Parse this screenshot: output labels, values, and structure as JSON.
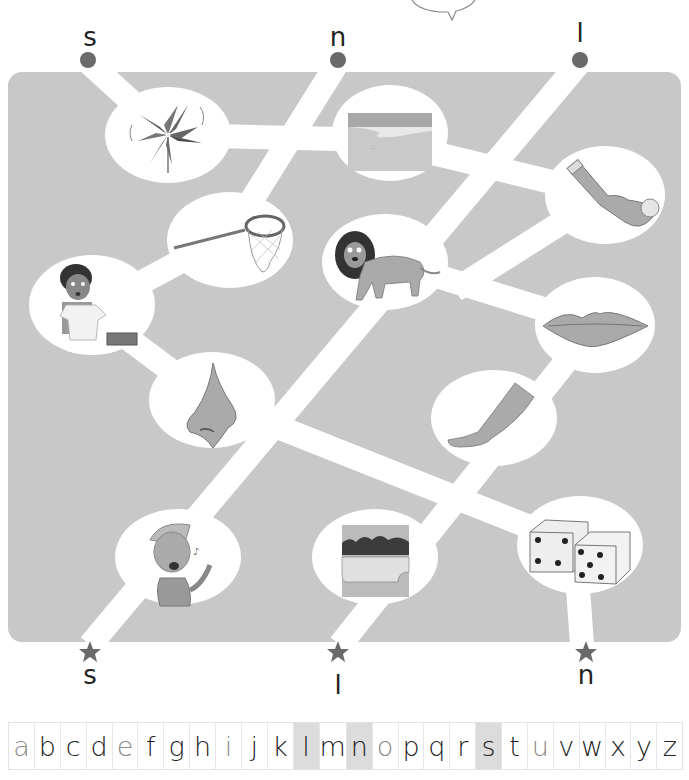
{
  "activity": {
    "type": "letter-sound maze",
    "start_letters": [
      "s",
      "n",
      "l"
    ],
    "end_letters": [
      "s",
      "l",
      "n"
    ]
  },
  "maze": {
    "colors": {
      "board": "#c8c8c8",
      "path": "#ffffff",
      "start_dot": "#6a6a6a",
      "end_star": "#6a6a6a"
    },
    "pictures": [
      {
        "id": "pinwheel",
        "label": "pinwheel",
        "initial": "p"
      },
      {
        "id": "sand",
        "label": "sand",
        "initial": "s"
      },
      {
        "id": "sock",
        "label": "sock",
        "initial": "s"
      },
      {
        "id": "net",
        "label": "net",
        "initial": "n"
      },
      {
        "id": "lion",
        "label": "lion",
        "initial": "l"
      },
      {
        "id": "boy-unwrapping",
        "label": "boy with shirt and box",
        "initial": "n"
      },
      {
        "id": "lips",
        "label": "lips",
        "initial": "l"
      },
      {
        "id": "nose",
        "label": "nose",
        "initial": "n"
      },
      {
        "id": "leg",
        "label": "leg",
        "initial": "l"
      },
      {
        "id": "singing-boy",
        "label": "sing",
        "initial": "s"
      },
      {
        "id": "lake",
        "label": "lake",
        "initial": "l"
      },
      {
        "id": "dice",
        "label": "dice",
        "initial": "d"
      }
    ]
  },
  "top_labels": [
    {
      "letter": "s",
      "x": 90
    },
    {
      "letter": "n",
      "x": 338
    },
    {
      "letter": "l",
      "x": 580
    }
  ],
  "bottom_labels": [
    {
      "letter": "s",
      "x": 90
    },
    {
      "letter": "l",
      "x": 338
    },
    {
      "letter": "n",
      "x": 586
    }
  ],
  "alphabet": {
    "letters": [
      "a",
      "b",
      "c",
      "d",
      "e",
      "f",
      "g",
      "h",
      "i",
      "j",
      "k",
      "l",
      "m",
      "n",
      "o",
      "p",
      "q",
      "r",
      "s",
      "t",
      "u",
      "v",
      "w",
      "x",
      "y",
      "z"
    ],
    "vowels": [
      "a",
      "e",
      "i",
      "o",
      "u"
    ],
    "highlighted": [
      "l",
      "n",
      "s"
    ]
  }
}
